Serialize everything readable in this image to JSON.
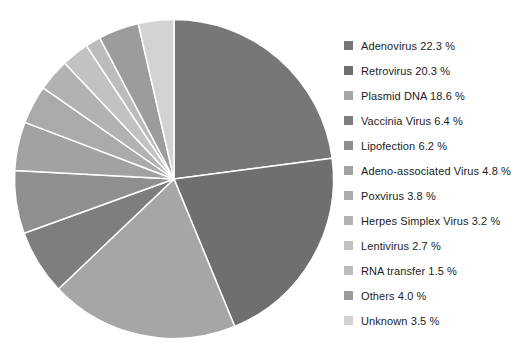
{
  "background_color": "#ffffff",
  "slice_divider_color": "#ffffff",
  "chart_data": {
    "type": "pie",
    "title": "",
    "legend_position": "right",
    "start_angle_deg": 0,
    "direction": "clockwise",
    "slices": [
      {
        "label": "Adenovirus",
        "value": 22.3,
        "legend_text": "Adenovirus 22.3 %",
        "color": "#777777"
      },
      {
        "label": "Retrovirus",
        "value": 20.3,
        "legend_text": "Retrovirus 20.3 %",
        "color": "#6f6f6f"
      },
      {
        "label": "Plasmid DNA",
        "value": 18.6,
        "legend_text": "Plasmid DNA 18.6 %",
        "color": "#a6a6a6"
      },
      {
        "label": "Vaccinia Virus",
        "value": 6.4,
        "legend_text": "Vaccinia Virus 6.4 %",
        "color": "#7e7e7e"
      },
      {
        "label": "Lipofection",
        "value": 6.2,
        "legend_text": "Lipofection 6.2 %",
        "color": "#8f8f8f"
      },
      {
        "label": "Adeno-associated Virus",
        "value": 4.8,
        "legend_text": "Adeno-associated Virus 4.8 %",
        "color": "#a2a2a2"
      },
      {
        "label": "Poxvirus",
        "value": 3.8,
        "legend_text": "Poxvirus 3.8 %",
        "color": "#aaaaaa"
      },
      {
        "label": "Herpes Simplex Virus",
        "value": 3.2,
        "legend_text": "Herpes Simplex Virus 3.2 %",
        "color": "#b2b2b2"
      },
      {
        "label": "Lentivirus",
        "value": 2.7,
        "legend_text": "Lentivirus 2.7 %",
        "color": "#c2c2c2"
      },
      {
        "label": "RNA transfer",
        "value": 1.5,
        "legend_text": "RNA transfer 1.5 %",
        "color": "#bcbcbc"
      },
      {
        "label": "Others",
        "value": 4.0,
        "legend_text": "Others 4.0 %",
        "color": "#9c9c9c"
      },
      {
        "label": "Unknown",
        "value": 3.5,
        "legend_text": "Unknown 3.5 %",
        "color": "#d2d2d2"
      }
    ],
    "geometry": {
      "center_x": 174,
      "center_y": 179,
      "radius": 159.5
    }
  }
}
